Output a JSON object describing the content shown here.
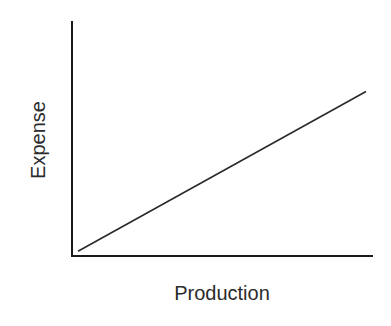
{
  "chart_data": {
    "type": "line",
    "title": "",
    "xlabel": "Production",
    "ylabel": "Expense",
    "xlim": [
      0,
      1
    ],
    "ylim": [
      0,
      1
    ],
    "grid": false,
    "legend": "none",
    "x_ticks": [],
    "y_ticks": [],
    "series": [
      {
        "name": "Expense vs Production",
        "x": [
          0.02,
          0.98
        ],
        "y": [
          0.02,
          0.7
        ]
      }
    ]
  },
  "colors": {
    "axis": "#1a1a1a",
    "line": "#2a2a2a",
    "text": "#2b2b2b",
    "background": "#ffffff"
  }
}
